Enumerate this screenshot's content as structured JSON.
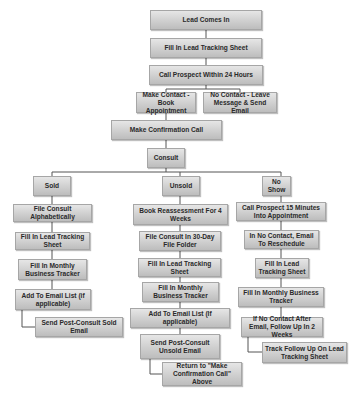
{
  "diagram": {
    "type": "flowchart",
    "nodes": {
      "lead_comes_in": "Lead Comes In",
      "fill_lead_sheet": "Fill In Lead Tracking Sheet",
      "call_prospect": "Call Prospect Within 24 Hours",
      "make_contact": "Make Contact - Book Appointment",
      "no_contact": "No Contact - Leave Message & Send Email",
      "confirmation_call": "Make Confirmation Call",
      "consult": "Consult",
      "sold": "Sold",
      "unsold": "Unsold",
      "no_show": "No Show",
      "sold_file_consult": "File Consult Alphabetically",
      "sold_fill_lead_sheet": "Fill In Lead Tracking Sheet",
      "sold_fill_monthly": "Fill In Monthly Business Tracker",
      "sold_add_email": "Add To Email List (if applicable)",
      "sold_send_email": "Send Post-Consult Sold Email",
      "unsold_book_reassess": "Book Reassessment For 4 Weeks",
      "unsold_file_consult": "File Consult In 30-Day File Folder",
      "unsold_fill_lead_sheet": "Fill In Lead Tracking Sheet",
      "unsold_fill_monthly": "Fill In Monthly Business Tracker",
      "unsold_add_email": "Add To Email List (If applicable)",
      "unsold_send_email": "Send Post-Consult Unsold Email",
      "unsold_return": "Return to \"Make Confirmation Call\" Above",
      "noshow_call": "Call Prospect 15 Minutes Into Appointment",
      "noshow_email": "In No Contact, Email To Reschedule",
      "noshow_fill_lead_sheet": "Fill In Lead Tracking Sheet",
      "noshow_fill_monthly": "Fill In Monthly Business Tracker",
      "noshow_follow_up": "If No Contact After Email, Follow Up In 2 Weeks",
      "noshow_track": "Track Follow Up On Lead Tracking Sheet"
    },
    "colors": {
      "box_top": "#e6e6e6",
      "box_bottom": "#bdbdbd",
      "border": "#a6a6a6",
      "text": "#2a2a2a",
      "connector": "#555555"
    }
  }
}
